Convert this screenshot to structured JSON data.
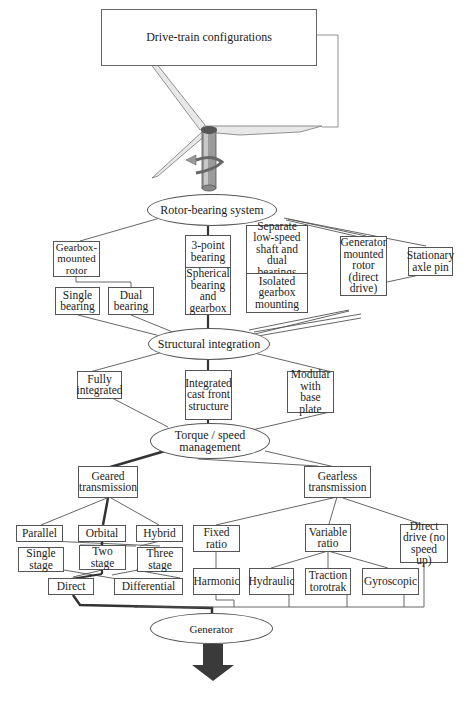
{
  "title": "Drive-train configurations",
  "level1": {
    "root": "Rotor-bearing system",
    "options": [
      {
        "id": "gearbox_mounted",
        "label": "Gearbox-mounted rotor"
      },
      {
        "id": "single_bearing",
        "label": "Single bearing"
      },
      {
        "id": "dual_bearing",
        "label": "Dual bearing"
      },
      {
        "id": "three_point",
        "label": "3-point bearing"
      },
      {
        "id": "spherical",
        "label": "Spherical bearing and gearbox"
      },
      {
        "id": "separate_ls",
        "label": "Separate low-speed shaft and dual bearings"
      },
      {
        "id": "isolated_gb",
        "label": "Isolated gearbox mounting"
      },
      {
        "id": "generator_mounted",
        "label": "Generator mounted rotor (direct drive)"
      },
      {
        "id": "stationary_axle",
        "label": "Stationary axle pin"
      }
    ]
  },
  "level2": {
    "root": "Structural integration",
    "options": [
      {
        "id": "fully",
        "label": "Fully integrated"
      },
      {
        "id": "cast_front",
        "label": "Integrated cast front structure"
      },
      {
        "id": "modular",
        "label": "Modular with base plate"
      }
    ]
  },
  "level3": {
    "root": "Torque / speed management",
    "geared": {
      "label": "Geared transmission",
      "types": [
        "Parallel",
        "Orbital",
        "Hybrid"
      ],
      "stages": [
        "Single stage",
        "Two stage",
        "Three stage"
      ],
      "outputs": [
        "Direct",
        "Differential"
      ]
    },
    "gearless": {
      "label": "Gearless transmission",
      "fixed": "Fixed ratio",
      "harmonic": "Harmonic",
      "variable": "Variable ratio",
      "variable_types": [
        "Hydraulic",
        "Traction torotrak",
        "Gyroscopic"
      ],
      "direct": "Direct drive (no speed up)"
    }
  },
  "generator": "Generator",
  "colors": {
    "line": "#555555",
    "highlight": "#333333",
    "arrow": "#3a3a3a",
    "tower": "#7a7a7a"
  }
}
